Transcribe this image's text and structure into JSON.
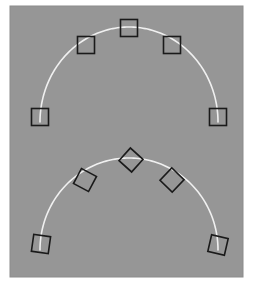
{
  "figure": {
    "width": 255,
    "height": 288,
    "background_color": "#ffffff",
    "panel": {
      "x": 10,
      "y": 6,
      "width": 233,
      "height": 271,
      "fill_color": "#969696",
      "border_color": "#8c8c8c"
    }
  },
  "chart_data": {
    "type": "scatter",
    "title": "",
    "xlabel": "",
    "ylabel": "",
    "grid": false,
    "legend": null,
    "axes_visible": false,
    "xlim": [
      10,
      243
    ],
    "ylim": [
      6,
      277
    ],
    "line_color": "#f0f0f0",
    "line_width": 1.6,
    "marker_edge_color": "#1a1a1a",
    "marker_face_color": "none",
    "marker_edge_width": 1.6,
    "series": [
      {
        "name": "upper-arc",
        "marker": "square",
        "marker_rotation_mode": "axis-aligned",
        "marker_size": 17,
        "curve": {
          "type": "arc",
          "center_x": 129,
          "center_y": 122,
          "radius_x": 89,
          "radius_y": 95,
          "start_angle_deg": 180,
          "end_angle_deg": 360
        },
        "points": [
          {
            "x": 40,
            "y": 117,
            "angle_deg": 0
          },
          {
            "x": 86,
            "y": 45,
            "angle_deg": 0
          },
          {
            "x": 129,
            "y": 28,
            "angle_deg": 0
          },
          {
            "x": 172,
            "y": 45,
            "angle_deg": 0
          },
          {
            "x": 218,
            "y": 117,
            "angle_deg": 0
          }
        ]
      },
      {
        "name": "lower-arc",
        "marker": "square",
        "marker_rotation_mode": "tangent-aligned",
        "marker_size": 17,
        "curve": {
          "type": "arc",
          "center_x": 129,
          "center_y": 250,
          "radius_x": 89,
          "radius_y": 92,
          "start_angle_deg": 180,
          "end_angle_deg": 360
        },
        "points": [
          {
            "x": 41,
            "y": 244,
            "angle_deg": 8
          },
          {
            "x": 85,
            "y": 180,
            "angle_deg": 28
          },
          {
            "x": 131,
            "y": 160,
            "angle_deg": 42
          },
          {
            "x": 172,
            "y": 180,
            "angle_deg": 44
          },
          {
            "x": 218,
            "y": 245,
            "angle_deg": 13
          }
        ]
      }
    ]
  }
}
